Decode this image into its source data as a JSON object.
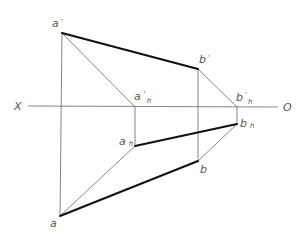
{
  "diagram": {
    "type": "descriptive-geometry-projection",
    "axis": {
      "left_label": "X",
      "right_label": "O"
    },
    "points": {
      "a_prime": {
        "label": "a",
        "mark": "'",
        "x": 62,
        "y": 33
      },
      "b_prime": {
        "label": "b",
        "mark": "'",
        "x": 198,
        "y": 69
      },
      "a_prime_h": {
        "label": "a",
        "mark": "'",
        "sub": "h",
        "x": 135,
        "y": 107
      },
      "b_prime_h": {
        "label": "b",
        "mark": "'",
        "sub": "h",
        "x": 237,
        "y": 107
      },
      "a_h": {
        "label": "a",
        "sub": "h",
        "x": 135,
        "y": 146
      },
      "b_h": {
        "label": "b",
        "sub": "h",
        "x": 237,
        "y": 124
      },
      "a": {
        "label": "a",
        "x": 60,
        "y": 216
      },
      "b": {
        "label": "b",
        "x": 198,
        "y": 161
      }
    },
    "segments": {
      "thick": [
        "a'-b'",
        "a_h-b_h",
        "a-b"
      ],
      "thin": [
        "a'-a",
        "b'-b",
        "a'-a'h",
        "b'-b'h",
        "a'h-a_h",
        "b'h-b_h",
        "a_h-a",
        "b_h-b",
        "X-O axis"
      ]
    }
  }
}
